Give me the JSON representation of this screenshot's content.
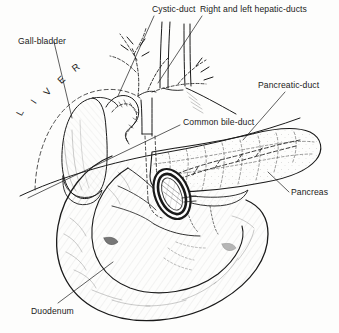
{
  "figure": {
    "background_color": "#fdfdfc",
    "ink_color": "#1a1a1a",
    "width": 339,
    "height": 333
  },
  "labels": {
    "cystic_duct": "Cystic-duct",
    "hepatic_ducts": "Right and left hepatic-ducts",
    "gall_bladder": "Gall-bladder",
    "pancreatic_duct": "Pancreatic-duct",
    "common_bile_duct": "Common bile-duct",
    "pancreas": "Pancreas",
    "duodenum": "Duodenum"
  },
  "liver_letters": [
    "L",
    "I",
    "V",
    "E",
    "R"
  ],
  "structures": [
    {
      "name": "liver",
      "label": "L I V E R"
    },
    {
      "name": "gall-bladder",
      "label": "Gall-bladder"
    },
    {
      "name": "cystic-duct",
      "label": "Cystic-duct"
    },
    {
      "name": "right-and-left-hepatic-ducts",
      "label": "Right and left hepatic-ducts"
    },
    {
      "name": "common-bile-duct",
      "label": "Common bile-duct"
    },
    {
      "name": "pancreatic-duct",
      "label": "Pancreatic-duct"
    },
    {
      "name": "pancreas",
      "label": "Pancreas"
    },
    {
      "name": "duodenum",
      "label": "Duodenum"
    },
    {
      "name": "ampulla-of-vater",
      "label": ""
    }
  ]
}
